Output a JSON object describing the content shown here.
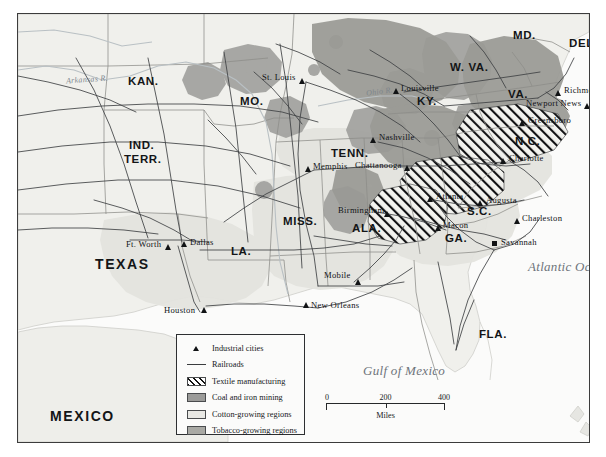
{
  "map": {
    "title": "Industry and Agriculture of the New South",
    "frame": {
      "border_color": "#3c3c3c",
      "land_color": "#f0f0ec"
    },
    "colors": {
      "cotton": "#e8e8e4",
      "coal_iron": "#9b9b99",
      "tobacco": "#a9a9a4",
      "textile_hatch": "#111111",
      "railroad": "#4a4c4e",
      "water": "#fafafa",
      "ocean_label": "#6e747a"
    },
    "water_bodies": [
      {
        "name": "Atlantic Ocean",
        "label": "Atlantic\nOcean",
        "x": 531,
        "y": 254
      },
      {
        "name": "Gulf of Mexico",
        "label": "Gulf of Mexico",
        "x": 403,
        "y": 356
      }
    ],
    "rivers": [
      {
        "name": "Arkansas R.",
        "label": "Arkansas R.",
        "x": 63,
        "y": 67
      },
      {
        "name": "Ohio R.",
        "label": "Ohio R.",
        "x": 357,
        "y": 79
      }
    ],
    "states": [
      {
        "label": "KAN.",
        "x": 129,
        "y": 67,
        "size": "normal"
      },
      {
        "label": "MO.",
        "x": 238,
        "y": 87,
        "size": "normal"
      },
      {
        "label": "IND.",
        "x": 130,
        "y": 137,
        "size": "normal"
      },
      {
        "label": "TERR.",
        "x": 127,
        "y": 149,
        "size": "normal"
      },
      {
        "label": "KY.",
        "x": 416,
        "y": 88,
        "size": "normal"
      },
      {
        "label": "W. VA.",
        "x": 459,
        "y": 58,
        "size": "normal"
      },
      {
        "label": "VA.",
        "x": 506,
        "y": 81,
        "size": "normal"
      },
      {
        "label": "MD.",
        "x": 512,
        "y": 25,
        "size": "normal"
      },
      {
        "label": "DEL.",
        "x": 567,
        "y": 33,
        "size": "normal"
      },
      {
        "label": "TENN.",
        "x": 337,
        "y": 142,
        "size": "normal"
      },
      {
        "label": "N.C.",
        "x": 513,
        "y": 130,
        "size": "normal"
      },
      {
        "label": "S.C.",
        "x": 464,
        "y": 200,
        "size": "normal"
      },
      {
        "label": "GA.",
        "x": 441,
        "y": 227,
        "size": "normal"
      },
      {
        "label": "ALA.",
        "x": 351,
        "y": 217,
        "size": "normal"
      },
      {
        "label": "MISS.",
        "x": 285,
        "y": 210,
        "size": "normal"
      },
      {
        "label": "LA.",
        "x": 225,
        "y": 240,
        "size": "normal"
      },
      {
        "label": "FLA.",
        "x": 476,
        "y": 323,
        "size": "normal"
      },
      {
        "label": "TEXAS",
        "x": 105,
        "y": 252,
        "size": "big"
      },
      {
        "label": "MEXICO",
        "x": 60,
        "y": 404,
        "size": "big"
      }
    ],
    "cities": [
      {
        "name": "St. Louis",
        "label": "St. Louis",
        "x": 285,
        "y": 67,
        "side": "left",
        "marker": "triangle"
      },
      {
        "name": "Louisville",
        "label": "Louisville",
        "x": 382,
        "y": 78,
        "side": "right",
        "marker": "triangle"
      },
      {
        "name": "Richmond",
        "label": "Richmond",
        "x": 545,
        "y": 80,
        "side": "right",
        "marker": "triangle"
      },
      {
        "name": "Newport News",
        "label": "Newport News",
        "x": 557,
        "y": 92,
        "side": "left",
        "marker": "triangle"
      },
      {
        "name": "Greensboro",
        "label": "Greensboro",
        "x": 509,
        "y": 110,
        "side": "right",
        "marker": "triangle"
      },
      {
        "name": "Nashville",
        "label": "Nashville",
        "x": 359,
        "y": 127,
        "side": "right",
        "marker": "triangle"
      },
      {
        "name": "Memphis",
        "label": "Memphis",
        "x": 294,
        "y": 156,
        "side": "right",
        "marker": "triangle"
      },
      {
        "name": "Chattanooga",
        "label": "Chattanooga",
        "x": 388,
        "y": 155,
        "side": "left",
        "marker": "triangle"
      },
      {
        "name": "Charlotte",
        "label": "Charlotte",
        "x": 490,
        "y": 148,
        "side": "right",
        "marker": "triangle"
      },
      {
        "name": "Augusta",
        "label": "Augusta",
        "x": 467,
        "y": 190,
        "side": "right",
        "marker": "triangle"
      },
      {
        "name": "Atlanta",
        "label": "Atlanta",
        "x": 416,
        "y": 186,
        "side": "right",
        "marker": "triangle"
      },
      {
        "name": "Birmingham",
        "label": "Birmingham",
        "x": 359,
        "y": 198,
        "side": "left",
        "marker": "triangle"
      },
      {
        "name": "Macon",
        "label": "Macon",
        "x": 424,
        "y": 215,
        "side": "right",
        "marker": "triangle"
      },
      {
        "name": "Charleston",
        "label": "Charleston",
        "x": 503,
        "y": 208,
        "side": "right",
        "marker": "triangle"
      },
      {
        "name": "Savannah",
        "label": "Savannah",
        "x": 484,
        "y": 231,
        "side": "right",
        "marker": "square"
      },
      {
        "name": "Ft. Worth",
        "label": "Ft. Worth",
        "x": 147,
        "y": 234,
        "side": "left",
        "marker": "triangle"
      },
      {
        "name": "Dallas",
        "label": "Dallas",
        "x": 160,
        "y": 231,
        "side": "right",
        "marker": "triangle"
      },
      {
        "name": "Mobile",
        "label": "Mobile",
        "x": 337,
        "y": 268,
        "side": "left",
        "marker": "triangle"
      },
      {
        "name": "New Orleans",
        "label": "New Orleans",
        "x": 292,
        "y": 294,
        "side": "right",
        "marker": "triangle"
      },
      {
        "name": "Houston",
        "label": "Houston",
        "x": 184,
        "y": 298,
        "side": "left",
        "marker": "triangle"
      }
    ]
  },
  "legend": {
    "items": [
      {
        "key": "industrial-cities",
        "label": "Industrial cities",
        "symbol": "triangle"
      },
      {
        "key": "railroads",
        "label": "Railroads",
        "symbol": "line"
      },
      {
        "key": "textile",
        "label": "Textile manufacturing",
        "symbol": "hatch-swatch"
      },
      {
        "key": "coal-iron",
        "label": "Coal and iron mining",
        "symbol": "gray-swatch"
      },
      {
        "key": "cotton",
        "label": "Cotton-growing regions",
        "symbol": "light-swatch"
      },
      {
        "key": "tobacco",
        "label": "Tobacco-growing regions",
        "symbol": "dark-swatch"
      }
    ]
  },
  "scale": {
    "ticks": [
      "0",
      "200",
      "400"
    ],
    "unit": "Miles"
  }
}
